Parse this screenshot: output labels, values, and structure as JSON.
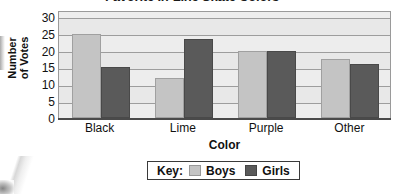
{
  "chart_data": {
    "type": "bar",
    "title": "Favorite In-Line Skate Colors",
    "title_note": "title is cropped off the top edge of the screenshot",
    "xlabel": "Color",
    "ylabel": "Number of Votes",
    "ylabel_line1": "Number",
    "ylabel_line2": "of Votes",
    "categories": [
      "Black",
      "Lime",
      "Purple",
      "Other"
    ],
    "series": [
      {
        "name": "Boys",
        "color": "#c4c4c4",
        "values": [
          25,
          12,
          20,
          17.5
        ]
      },
      {
        "name": "Girls",
        "color": "#5a5a5a",
        "values": [
          15,
          23.5,
          20,
          16
        ]
      }
    ],
    "ylim": [
      0,
      32
    ],
    "yticks": [
      0,
      5,
      10,
      15,
      20,
      25,
      30
    ],
    "ytick_labels": [
      "0",
      "5",
      "10",
      "15",
      "20",
      "25",
      "30"
    ],
    "grid": true,
    "grid_orientation": "horizontal",
    "legend_position": "bottom-center",
    "legend_title": "Key:",
    "plot_background": "#e8e8e8",
    "grid_color": "#9d9d9d"
  },
  "legend": {
    "key_label": "Key:",
    "entries": [
      {
        "label": "Boys",
        "color": "#c4c4c4"
      },
      {
        "label": "Girls",
        "color": "#5a5a5a"
      }
    ]
  }
}
